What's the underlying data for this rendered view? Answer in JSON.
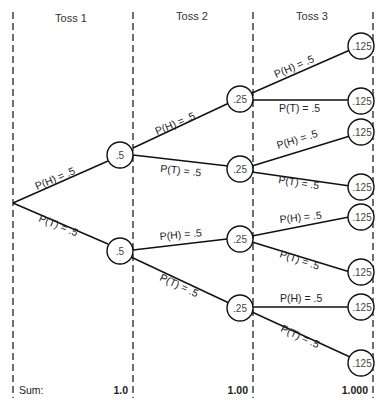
{
  "diagram": {
    "type": "probability-tree",
    "columns": [
      {
        "header": "Toss 1",
        "sum": "1.0"
      },
      {
        "header": "Toss 2",
        "sum": "1.00"
      },
      {
        "header": "Toss 3",
        "sum": "1.000"
      }
    ],
    "sum_label": "Sum:",
    "branch_labels": {
      "heads": "P(H) = .5",
      "tails": "P(T) = .5"
    },
    "nodes": {
      "level1": [
        ".5",
        ".5"
      ],
      "level2": [
        ".25",
        ".25",
        ".25",
        ".25"
      ],
      "level3": [
        ".125",
        ".125",
        ".125",
        ".125",
        ".125",
        ".125",
        ".125",
        ".125"
      ]
    }
  }
}
